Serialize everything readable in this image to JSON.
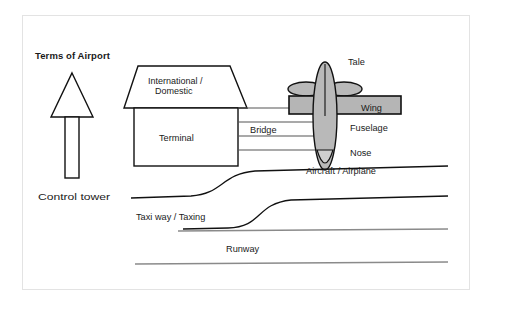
{
  "diagram": {
    "title": "Terms of Airport",
    "labels": {
      "control_tower": "Control tower",
      "roof": "International /",
      "roof_line2": "Domestic",
      "terminal": "Terminal",
      "bridge": "Bridge",
      "tale": "Tale",
      "wing": "Wing",
      "fuselage": "Fuselage",
      "nose": "Nose",
      "aircraft": "Aircraft / Airplane",
      "taxiway": "Taxi way / Taxing",
      "runway": "Runway"
    },
    "colors": {
      "background": "#ffffff",
      "card_border": "#e3e3e3",
      "ink": "#111111",
      "plane_body": "#b9b9b9",
      "plane_nose": "#cfcfcf",
      "wing_fill": "#b5b5b5",
      "runway_line": "#8a8a8a"
    }
  }
}
